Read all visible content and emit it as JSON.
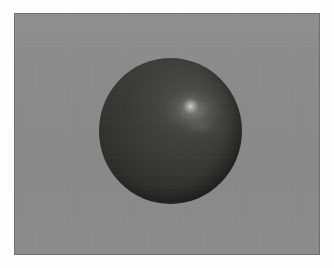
{
  "figure": {
    "caption": "",
    "frame": {
      "border_color": "#6f6f6f",
      "page_color": "#fdfdfd",
      "x": 14,
      "y": 13,
      "width": 306,
      "height": 242
    },
    "background": {
      "name": "render-backdrop",
      "color": "#8b8b8b",
      "description": "flat neutral gray plate"
    },
    "sphere": {
      "name": "sphere",
      "center_x": 169,
      "center_y": 130,
      "diameter_x": 143,
      "diameter_y": 146,
      "base_color": "#363635",
      "light_side_color": "#4f4f4e",
      "shadow_side_color": "#2c2c2b",
      "material": "matte dark gray with specular highlight"
    },
    "highlight": {
      "name": "specular-highlight",
      "center_x": 186,
      "center_y": 103,
      "color": "#d6d6d0",
      "shape": "soft elongated bloom trailing toward lower-right",
      "light_direction": "upper-right"
    },
    "artifacts": {
      "name": "compression-banding",
      "description": "faint horizontal banding and block noise"
    }
  }
}
